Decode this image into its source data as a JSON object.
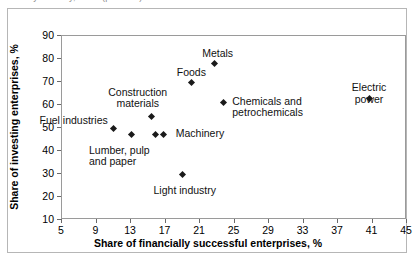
{
  "clipped_header_fragment": "by industry, 2000 (per cent)",
  "chart_data": {
    "type": "scatter",
    "title": "",
    "xlabel": "Share of financially successful enterprises, %",
    "ylabel": "Share of investing enterprises, %",
    "xlim": [
      5,
      45
    ],
    "ylim": [
      10,
      90
    ],
    "xticks": [
      5,
      9,
      13,
      17,
      21,
      25,
      29,
      33,
      37,
      41,
      45
    ],
    "yticks": [
      10,
      20,
      30,
      40,
      50,
      60,
      70,
      80,
      90
    ],
    "grid": false,
    "legend": "none",
    "marker": "diamond",
    "marker_color": "#1a1a1a",
    "points": [
      {
        "label": "Fuel industries",
        "x": 11.0,
        "y": 50,
        "label_pos": "right",
        "label_dx": -6,
        "label_dy": -13
      },
      {
        "label": "Lumber, pulp\nand paper",
        "x": 13.0,
        "y": 47,
        "label_pos": "left",
        "label_dx": -42,
        "label_dy": 10
      },
      {
        "label": "Construction\nmaterials",
        "x": 15.4,
        "y": 55,
        "label_pos": "center",
        "label_dx": -14,
        "label_dy": -30
      },
      {
        "label": "Machinery",
        "x": 16.8,
        "y": 47,
        "label_pos": "left",
        "label_dx": 12,
        "label_dy": -7
      },
      {
        "label": "",
        "x": 15.8,
        "y": 47,
        "label_pos": "left",
        "label_dx": 0,
        "label_dy": 0
      },
      {
        "label": "Light industry",
        "x": 19.0,
        "y": 30,
        "label_pos": "center",
        "label_dx": 2,
        "label_dy": 11
      },
      {
        "label": "Foods",
        "x": 20.0,
        "y": 70,
        "label_pos": "center",
        "label_dx": 0,
        "label_dy": -15
      },
      {
        "label": "Metals",
        "x": 22.7,
        "y": 78,
        "label_pos": "center",
        "label_dx": 3,
        "label_dy": -16
      },
      {
        "label": "Chemicals and\npetrochemicals",
        "x": 23.7,
        "y": 61,
        "label_pos": "left",
        "label_dx": 9,
        "label_dy": -7
      },
      {
        "label": "Electric power",
        "x": 40.6,
        "y": 63,
        "label_pos": "center",
        "label_dx": 0,
        "label_dy": -16
      }
    ]
  }
}
